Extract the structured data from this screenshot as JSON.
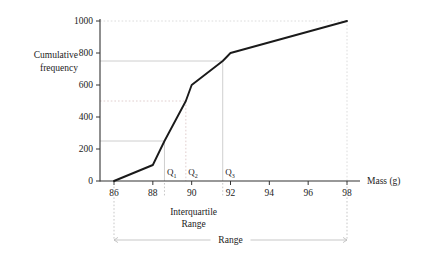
{
  "chart_data": {
    "type": "line",
    "title": "",
    "xlabel": "Mass (g)",
    "ylabel": "Cumulative frequency",
    "xlim": [
      85.2,
      98.8
    ],
    "ylim": [
      0,
      1040
    ],
    "xticks": [
      86,
      88,
      90,
      92,
      94,
      96,
      98
    ],
    "xtick_labels": [
      "86",
      "88",
      "90",
      "92",
      "94",
      "96",
      "98"
    ],
    "yticks": [
      0,
      200,
      400,
      600,
      800,
      1000
    ],
    "ytick_labels": [
      "0",
      "200",
      "400",
      "600",
      "800",
      "1000"
    ],
    "grid": false,
    "legend": "none",
    "x": [
      86,
      88,
      88.6,
      89.7,
      90,
      91.6,
      92,
      98
    ],
    "values": [
      0,
      100,
      250,
      500,
      600,
      750,
      800,
      1000
    ],
    "series": [
      {
        "name": "Cumulative frequency",
        "x": [
          86,
          88,
          88.6,
          89.7,
          90,
          91.6,
          92,
          98
        ],
        "values": [
          0,
          100,
          250,
          500,
          600,
          750,
          800,
          1000
        ],
        "color": "#1a1a1a"
      }
    ],
    "guide_lines": [
      {
        "name": "lower-quartile-guide",
        "y": 250,
        "x": 88.6,
        "style": "solid-gray",
        "color": "#c8c8c8"
      },
      {
        "name": "median-guide",
        "y": 500,
        "x": 89.7,
        "style": "dashed",
        "color": "#dcc8c8"
      },
      {
        "name": "upper-quartile-guide",
        "y": 750,
        "x": 91.6,
        "style": "solid-gray",
        "color": "#c8c8c8"
      },
      {
        "name": "max-guide",
        "y": 1000,
        "x": 98,
        "style": "dashed",
        "color": "#d8d8d8"
      }
    ],
    "annotations": [
      {
        "name": "q1",
        "label": "Q",
        "sub": "1",
        "x": 88.6,
        "value": 250
      },
      {
        "name": "q2",
        "label": "Q",
        "sub": "2",
        "x": 89.7,
        "value": 500
      },
      {
        "name": "q3",
        "label": "Q",
        "sub": "3",
        "x": 91.6,
        "value": 750
      }
    ],
    "measures": [
      {
        "name": "interquartile-range",
        "label_line1": "Interquartile",
        "label_line2": "Range",
        "from": 88.6,
        "to": 91.6
      },
      {
        "name": "range",
        "label_line1": "Range",
        "label_line2": "",
        "from": 86,
        "to": 98
      }
    ],
    "colors": {
      "curve": "#1a1a1a",
      "axis": "#333333",
      "gridline_gray": "#c9c9c9",
      "gridline_pink": "#e0cccc",
      "measure_arrow": "#b9b9b9",
      "background": "#ffffff"
    }
  }
}
